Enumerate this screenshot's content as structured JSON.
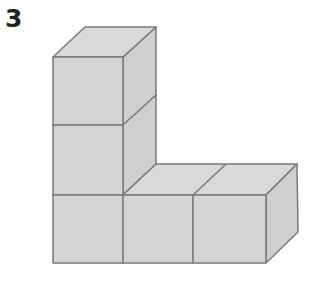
{
  "problem": {
    "number": "3"
  },
  "figure": {
    "cube_count": 5,
    "colors": {
      "fill_front": "#d4d4d4",
      "fill_top": "#d9d9d9",
      "fill_side": "#cfcfcf",
      "stroke": "#7a7a7a"
    }
  }
}
